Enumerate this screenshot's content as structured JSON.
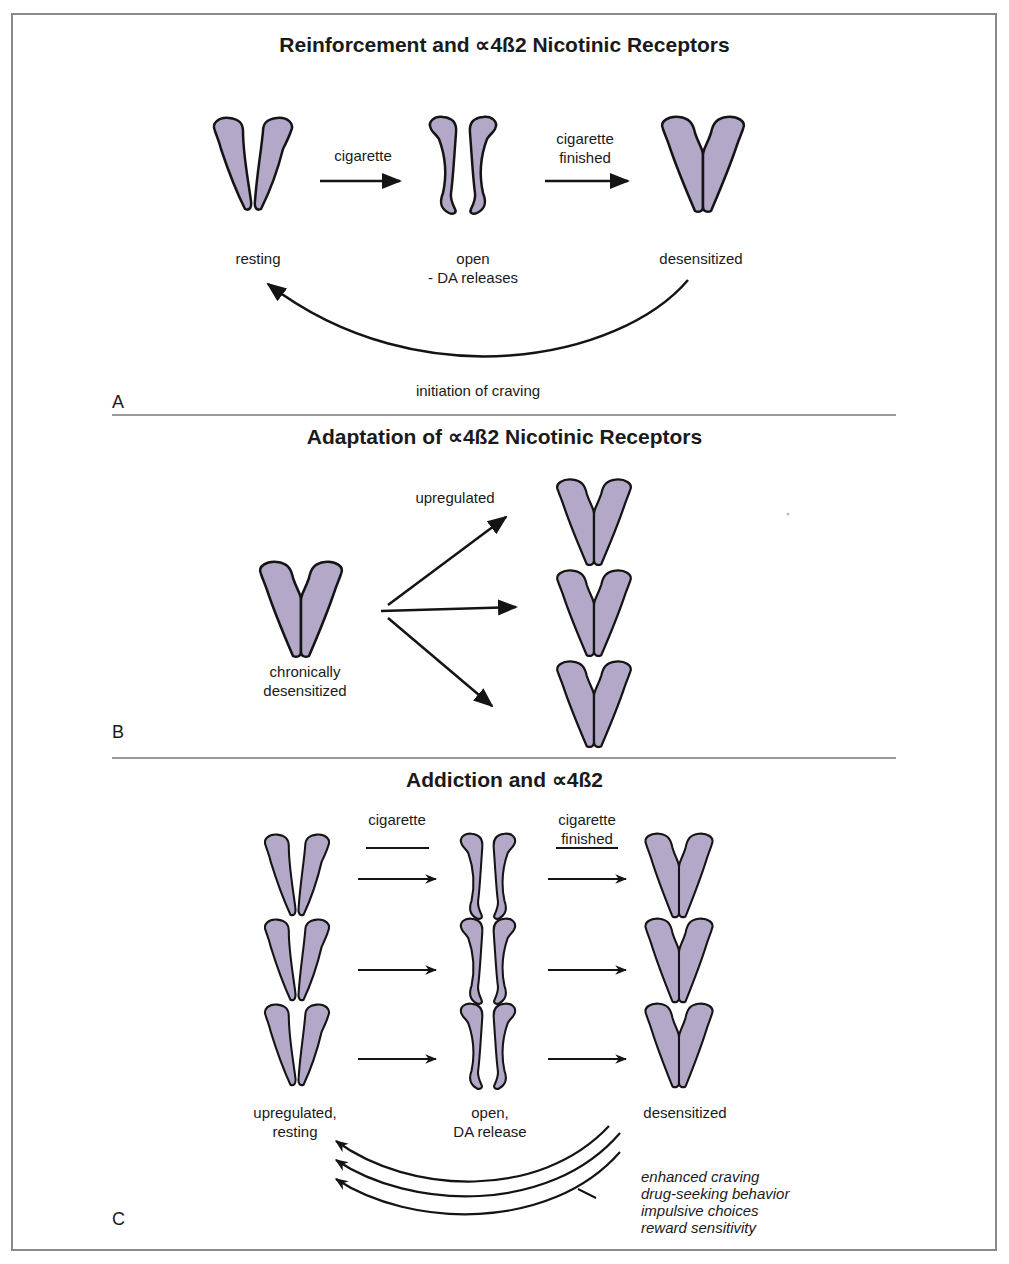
{
  "colors": {
    "receptor_fill": "#b3a8c8",
    "receptor_stroke": "#141414",
    "frame": "#8a8a8a",
    "divider": "#9a9a9a",
    "text": "#1a1a1a"
  },
  "panel_a": {
    "title": "Reinforcement and ∝4ß2 Nicotinic Receptors",
    "letter": "A",
    "states": [
      {
        "label": "resting",
        "sublabel": ""
      },
      {
        "label": "open",
        "sublabel": "- DA releases"
      },
      {
        "label": "desensitized",
        "sublabel": ""
      }
    ],
    "arrow_1_label": "cigarette",
    "arrow_2_label_line1": "cigarette",
    "arrow_2_label_line2": "finished",
    "return_arrow_label": "initiation of craving"
  },
  "panel_b": {
    "title": "Adaptation of ∝4ß2 Nicotinic Receptors",
    "letter": "B",
    "source_label_line1": "chronically",
    "source_label_line2": "desensitized",
    "arrows_label": "upregulated",
    "upregulated_receptor_count": 3
  },
  "panel_c": {
    "title": "Addiction and ∝4ß2",
    "letter": "C",
    "arrow_1_label": "cigarette",
    "arrow_2_label_line1": "cigarette",
    "arrow_2_label_line2": "finished",
    "states": [
      {
        "label_line1": "upregulated,",
        "label_line2": "resting"
      },
      {
        "label_line1": "open,",
        "label_line2": "DA release"
      },
      {
        "label_line1": "desensitized",
        "label_line2": ""
      }
    ],
    "rows": 3,
    "effects": [
      "enhanced craving",
      "drug-seeking behavior",
      "impulsive choices",
      "reward sensitivity"
    ]
  }
}
